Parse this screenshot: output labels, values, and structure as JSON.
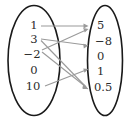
{
  "diagram": {
    "type": "mapping-diagram",
    "colors": {
      "ellipse_stroke": "#1a1a1a",
      "arrow": "#9a9a9a",
      "text": "#2b2b2b",
      "background": "#ffffff"
    },
    "domain_set": {
      "name": "left-set",
      "values": [
        "1",
        "3",
        "−2",
        "0",
        "10"
      ]
    },
    "codomain_set": {
      "name": "right-set",
      "values": [
        "5",
        "−8",
        "0",
        "1",
        "0.5"
      ]
    },
    "mappings": [
      {
        "from": "1",
        "to": "5"
      },
      {
        "from": "3",
        "to": "−8"
      },
      {
        "from": "3",
        "to": "0.5"
      },
      {
        "from": "−2",
        "to": "5"
      },
      {
        "from": "−2",
        "to": "0.5"
      },
      {
        "from": "10",
        "to": "1"
      }
    ]
  }
}
